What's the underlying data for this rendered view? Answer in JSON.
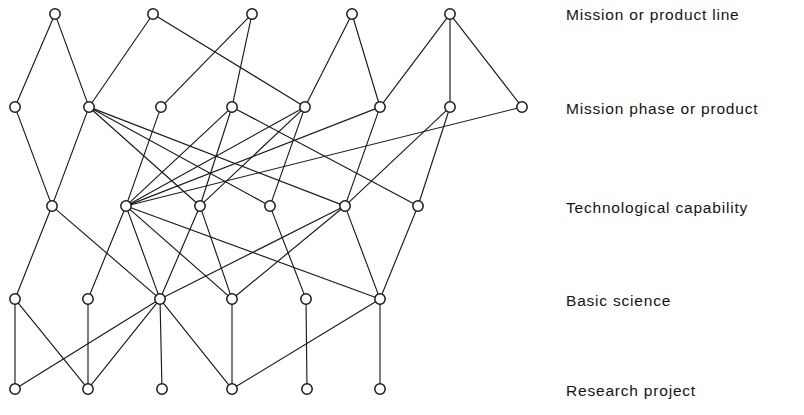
{
  "diagram": {
    "width": 804,
    "height": 415,
    "node_radius": 5.2,
    "colors": {
      "background": "#ffffff",
      "edge": "#1a1a1a",
      "node_stroke": "#1a1a1a",
      "node_fill": "#ffffff",
      "text": "#141414"
    },
    "tiers": [
      {
        "id": "mission-or-product-line",
        "label": "Mission or product line",
        "label_x": 566,
        "label_y": 7,
        "row_y": 14,
        "nodes_x": [
          55,
          153,
          252,
          352,
          450
        ]
      },
      {
        "id": "mission-phase-or-product",
        "label": "Mission phase or product",
        "label_x": 566,
        "label_y": 101,
        "row_y": 107,
        "nodes_x": [
          15,
          89,
          161,
          232,
          305,
          380,
          450,
          522
        ]
      },
      {
        "id": "technological-capability",
        "label": "Technological capability",
        "label_x": 566,
        "label_y": 200,
        "row_y": 206,
        "nodes_x": [
          52,
          126,
          200,
          270,
          345,
          418
        ]
      },
      {
        "id": "basic-science",
        "label": "Basic science",
        "label_x": 566,
        "label_y": 293,
        "row_y": 299,
        "nodes_x": [
          15,
          88,
          160,
          232,
          306,
          380
        ]
      },
      {
        "id": "research-project",
        "label": "Research project",
        "label_x": 566,
        "label_y": 383,
        "row_y": 389,
        "nodes_x": [
          15,
          88,
          162,
          232,
          307,
          380
        ]
      }
    ],
    "edges": [
      [
        0,
        0,
        1,
        0
      ],
      [
        0,
        0,
        1,
        1
      ],
      [
        0,
        1,
        1,
        1
      ],
      [
        0,
        1,
        1,
        4
      ],
      [
        0,
        2,
        1,
        2
      ],
      [
        0,
        2,
        1,
        3
      ],
      [
        0,
        3,
        1,
        4
      ],
      [
        0,
        3,
        1,
        5
      ],
      [
        0,
        4,
        1,
        5
      ],
      [
        0,
        4,
        1,
        6
      ],
      [
        0,
        4,
        1,
        7
      ],
      [
        1,
        0,
        2,
        0
      ],
      [
        1,
        1,
        2,
        0
      ],
      [
        1,
        1,
        2,
        2
      ],
      [
        1,
        1,
        2,
        3
      ],
      [
        1,
        1,
        2,
        4
      ],
      [
        1,
        2,
        2,
        1
      ],
      [
        1,
        3,
        2,
        1
      ],
      [
        1,
        3,
        2,
        2
      ],
      [
        1,
        3,
        2,
        5
      ],
      [
        1,
        4,
        2,
        1
      ],
      [
        1,
        4,
        2,
        2
      ],
      [
        1,
        4,
        2,
        3
      ],
      [
        1,
        5,
        2,
        1
      ],
      [
        1,
        5,
        2,
        4
      ],
      [
        1,
        6,
        2,
        4
      ],
      [
        1,
        6,
        2,
        5
      ],
      [
        1,
        7,
        2,
        1
      ],
      [
        2,
        0,
        3,
        0
      ],
      [
        2,
        0,
        3,
        2
      ],
      [
        2,
        1,
        3,
        1
      ],
      [
        2,
        1,
        3,
        2
      ],
      [
        2,
        1,
        3,
        3
      ],
      [
        2,
        1,
        3,
        5
      ],
      [
        2,
        2,
        3,
        2
      ],
      [
        2,
        2,
        3,
        3
      ],
      [
        2,
        3,
        3,
        4
      ],
      [
        2,
        4,
        3,
        2
      ],
      [
        2,
        4,
        3,
        3
      ],
      [
        2,
        4,
        3,
        5
      ],
      [
        2,
        5,
        3,
        5
      ],
      [
        3,
        0,
        4,
        0
      ],
      [
        3,
        0,
        4,
        1
      ],
      [
        3,
        1,
        4,
        1
      ],
      [
        3,
        2,
        4,
        0
      ],
      [
        3,
        2,
        4,
        1
      ],
      [
        3,
        2,
        4,
        2
      ],
      [
        3,
        2,
        4,
        3
      ],
      [
        3,
        3,
        4,
        3
      ],
      [
        3,
        4,
        4,
        4
      ],
      [
        3,
        5,
        4,
        3
      ],
      [
        3,
        5,
        4,
        5
      ]
    ]
  }
}
